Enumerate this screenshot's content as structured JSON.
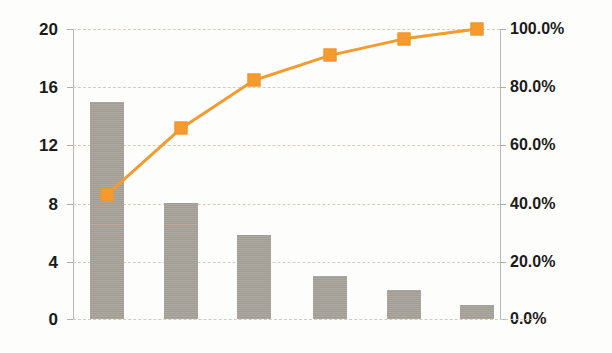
{
  "chart_data": {
    "type": "bar",
    "title": "",
    "subtitle": "",
    "xlabel": "",
    "ylabel": "",
    "categories": [
      "1",
      "2",
      "3",
      "4",
      "5",
      "6"
    ],
    "values": [
      15,
      8,
      5.8,
      3,
      2,
      1
    ],
    "ylim": [
      0,
      20
    ],
    "y_ticks": [
      0,
      4,
      8,
      12,
      16,
      20
    ],
    "y_tick_labels": [
      "0",
      "4",
      "8",
      "12",
      "16",
      "20"
    ],
    "grid": true,
    "legend": "none",
    "secondary_axis": {
      "type": "line",
      "name": "Cumulative %",
      "values": [
        42.9,
        65.7,
        82.3,
        90.9,
        96.6,
        100.0
      ],
      "ylim": [
        0,
        100
      ],
      "y_ticks": [
        0,
        20,
        40,
        60,
        80,
        100
      ],
      "y_tick_labels": [
        "0.0%",
        "20.0%",
        "40.0%",
        "60.0%",
        "80.0%",
        "100.0%"
      ],
      "marker": "square",
      "color": "#f59b2e"
    },
    "colors": {
      "bar": "#a8a49c",
      "line": "#f59b2e",
      "marker": "#f59b2e",
      "grid": "#d9c9b8",
      "axis": "#b9b7b2",
      "text": "#1b1b1b",
      "background": "#fdfdfc",
      "bar_seam": "#c9a79a"
    },
    "bar_seam_value": 6.5
  }
}
